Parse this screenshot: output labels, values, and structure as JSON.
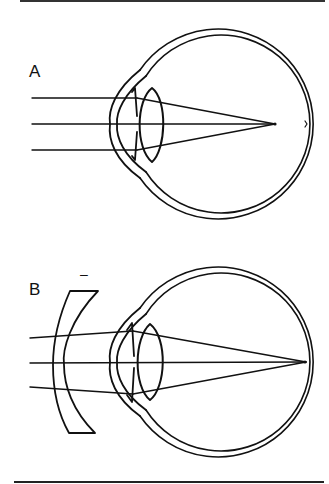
{
  "figure": {
    "panels": [
      {
        "id": "A",
        "label": "A",
        "description": "Myopic eye: parallel rays focus in front of the retina",
        "eye_center": [
          216,
          124
        ],
        "focus_point": [
          275,
          124
        ]
      },
      {
        "id": "B",
        "label": "B",
        "description": "Myopia corrected with a concave (minus) lens: rays focus on the retina",
        "lens_sign": "–",
        "eye_center": [
          216,
          362
        ],
        "focus_point": [
          306,
          362
        ]
      }
    ],
    "colors": {
      "line": "#111111",
      "background": "#ffffff"
    }
  }
}
